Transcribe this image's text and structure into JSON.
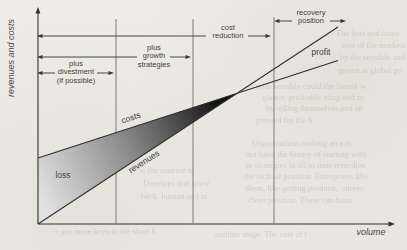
{
  "diagram": {
    "axes": {
      "y_label": "revenues and costs",
      "x_label": "volume"
    },
    "strategy_arrows": [
      {
        "id": "plus-divestment",
        "lines": [
          "plus",
          "divestment",
          "(if possible)"
        ]
      },
      {
        "id": "plus-growth-strategies",
        "lines": [
          "plus",
          "growth",
          "strategies"
        ]
      },
      {
        "id": "cost-reduction",
        "lines": [
          "cost",
          "reduction"
        ]
      },
      {
        "id": "recovery-position",
        "lines": [
          "recovery",
          "position"
        ]
      }
    ],
    "curve_labels": {
      "costs": "costs",
      "revenues": "revenues",
      "loss": "loss",
      "profit": "profit"
    },
    "colors": {
      "background": "#edebe6",
      "ink": "#3a3a3a",
      "wedge_light": "#e2e2e2",
      "wedge_dark": "#000000",
      "ghost_ink": "#a89f8e"
    }
  },
  "ghost_text": [
    {
      "text": "The best and come"
    },
    {
      "text": "tion of the markets"
    },
    {
      "text": "by the sensible and"
    },
    {
      "text": "grown at global po"
    },
    {
      "text": "with sensible could the famed w"
    },
    {
      "text": "glance, profitable sting and m"
    },
    {
      "text": "by telling themselves and an"
    },
    {
      "text": "pressed for the b"
    },
    {
      "text": "Organizations rushing an a m"
    },
    {
      "text": "not have the luxury of starting with"
    },
    {
      "text": "to strategies in all in time remedies"
    },
    {
      "text": "the tactical position. Enterprises like"
    },
    {
      "text": "them, like getting products, curves"
    },
    {
      "text": "clean position. These can burn"
    },
    {
      "text": "s, the relative m"
    },
    {
      "text": "Develops that grow"
    },
    {
      "text": "back, human and st"
    },
    {
      "text": "e got more keys to the short b"
    },
    {
      "text": "another stage. The cost of t"
    }
  ]
}
